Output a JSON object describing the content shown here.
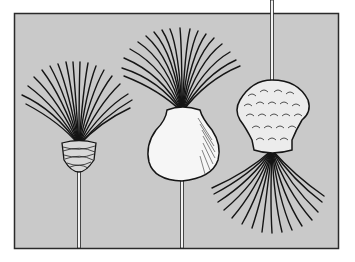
{
  "image": {
    "description": "Black-and-white line illustration of three brush-like objects on a gray panel: a bristle tuft bound with wrapped cord on a thin stem, a bristle tuft emerging from a rounded white bulb on a stem, and an inverted tuft hanging below a textured scaly cap suspended from a stem",
    "colors": {
      "panel": "#c9c9c9",
      "frame": "#2a2a2a",
      "ink": "#151515",
      "bulb": "#f6f6f6",
      "page": "#ffffff"
    },
    "objects": [
      {
        "name": "wrapped-brush",
        "stem_x": 79
      },
      {
        "name": "bulb-brush",
        "stem_x": 182
      },
      {
        "name": "hanging-brush",
        "stem_x": 272
      }
    ]
  }
}
